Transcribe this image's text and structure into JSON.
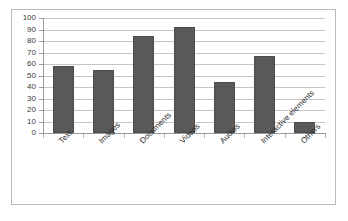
{
  "chart_data": {
    "type": "bar",
    "title": "",
    "subtitle": "",
    "xlabel": "",
    "ylabel": "",
    "categories": [
      "Text",
      "Images",
      "Documents",
      "Videos",
      "Audios",
      "Interactive elements",
      "Others"
    ],
    "values": [
      58,
      55,
      84,
      92,
      44,
      67,
      10
    ],
    "series": [
      {
        "name": "Series 1",
        "values": [
          58,
          55,
          84,
          92,
          44,
          67,
          10
        ]
      }
    ],
    "ylim": [
      0,
      100
    ],
    "ytick_labels": [
      "100",
      "90",
      "80",
      "70",
      "60",
      "50",
      "40",
      "30",
      "20",
      "10",
      "0"
    ],
    "ytick_values": [
      100,
      90,
      80,
      70,
      60,
      50,
      40,
      30,
      20,
      10,
      0
    ],
    "ytick_step": 10,
    "grid": true,
    "grid_axis": "y",
    "legend": false,
    "legend_position": "none",
    "annotations": [],
    "colors": {
      "bar_fill": "#595959",
      "bar_border": "#4c4c4c",
      "gridline": "#c6c6c6",
      "axis": "#9a9a9a",
      "frame": "#b9b9b9",
      "background": "#ffffff",
      "tick_text": "#3a3a3a",
      "category_text": "#2e2e2e"
    }
  }
}
